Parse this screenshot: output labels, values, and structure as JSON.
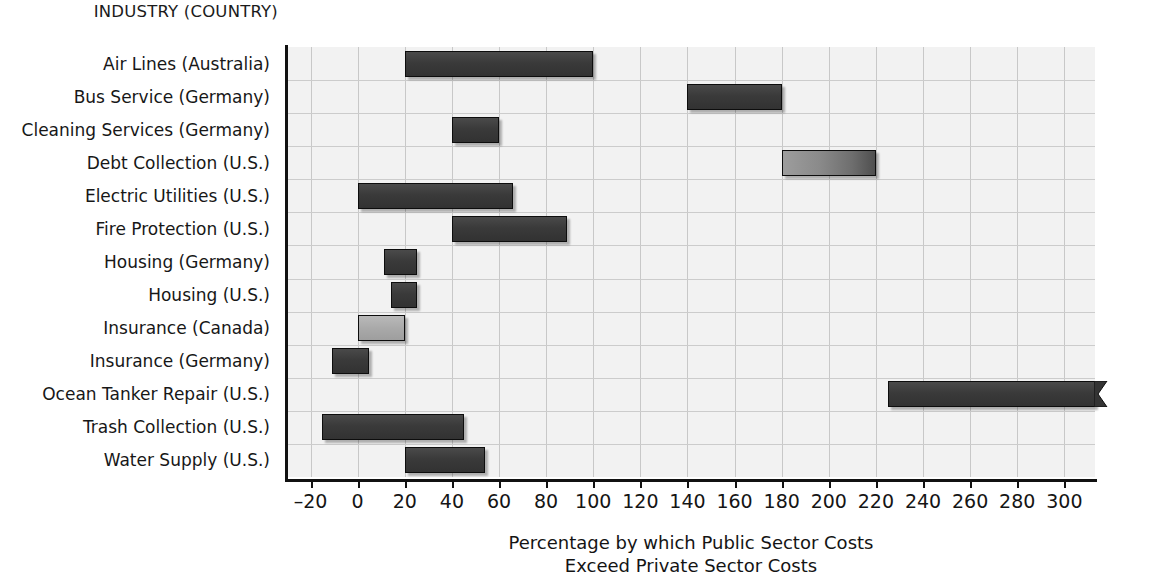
{
  "chart_data": {
    "type": "bar",
    "orientation": "horizontal",
    "subtype": "range-bar",
    "title": "",
    "category_axis_header": "INDUSTRY (COUNTRY)",
    "xlabel": "Percentage by which Public Sector Costs",
    "xlabel_line2": "Exceed Private Sector Costs",
    "ylabel": "",
    "xlim": [
      -30,
      313
    ],
    "grid": true,
    "legend": "none",
    "tick_labels": [
      "-20",
      "0",
      "20",
      "40",
      "60",
      "80",
      "100",
      "120",
      "140",
      "160",
      "180",
      "200",
      "220",
      "240",
      "260",
      "280",
      "300"
    ],
    "tick_values": [
      -20,
      0,
      20,
      40,
      60,
      80,
      100,
      120,
      140,
      160,
      180,
      200,
      220,
      240,
      260,
      280,
      300
    ],
    "categories": [
      "Air Lines (Australia)",
      "Bus Service (Germany)",
      "Cleaning Services (Germany)",
      "Debt Collection (U.S.)",
      "Electric Utilities (U.S.)",
      "Fire Protection (U.S.)",
      "Housing (Germany)",
      "Housing (U.S.)",
      "Insurance (Canada)",
      "Insurance (Germany)",
      "Ocean Tanker Repair (U.S.)",
      "Trash Collection (U.S.)",
      "Water Supply (U.S.)"
    ],
    "bars": [
      {
        "category": "Air Lines (Australia)",
        "low": 20,
        "high": 100,
        "style": "dark",
        "truncated": false
      },
      {
        "category": "Bus Service (Germany)",
        "low": 140,
        "high": 180,
        "style": "dark",
        "truncated": false
      },
      {
        "category": "Cleaning Services (Germany)",
        "low": 40,
        "high": 60,
        "style": "dark",
        "truncated": false
      },
      {
        "category": "Debt Collection (U.S.)",
        "low": 180,
        "high": 220,
        "style": "grad",
        "truncated": false
      },
      {
        "category": "Electric Utilities (U.S.)",
        "low": 0,
        "high": 66,
        "style": "dark",
        "truncated": false
      },
      {
        "category": "Fire Protection (U.S.)",
        "low": 40,
        "high": 89,
        "style": "dark",
        "truncated": false
      },
      {
        "category": "Housing (Germany)",
        "low": 11,
        "high": 25,
        "style": "dark",
        "truncated": false
      },
      {
        "category": "Housing (U.S.)",
        "low": 14,
        "high": 25,
        "style": "dark",
        "truncated": false
      },
      {
        "category": "Insurance (Canada)",
        "low": 0,
        "high": 20,
        "style": "light",
        "truncated": false
      },
      {
        "category": "Insurance (Germany)",
        "low": -11,
        "high": 5,
        "style": "dark",
        "truncated": false
      },
      {
        "category": "Ocean Tanker Repair (U.S.)",
        "low": 225,
        "high": 313,
        "style": "dark",
        "truncated": true
      },
      {
        "category": "Trash Collection (U.S.)",
        "low": -15,
        "high": 45,
        "style": "dark",
        "truncated": false
      },
      {
        "category": "Water Supply (U.S.)",
        "low": 20,
        "high": 54,
        "style": "dark",
        "truncated": false
      }
    ]
  },
  "colors": {
    "bar_dark": "#3a3a3a",
    "bar_light": "#a8a8a8",
    "plot_background": "#f2f2f2",
    "gridline": "#c8c8c8",
    "axis": "#111111",
    "text": "#151515"
  }
}
